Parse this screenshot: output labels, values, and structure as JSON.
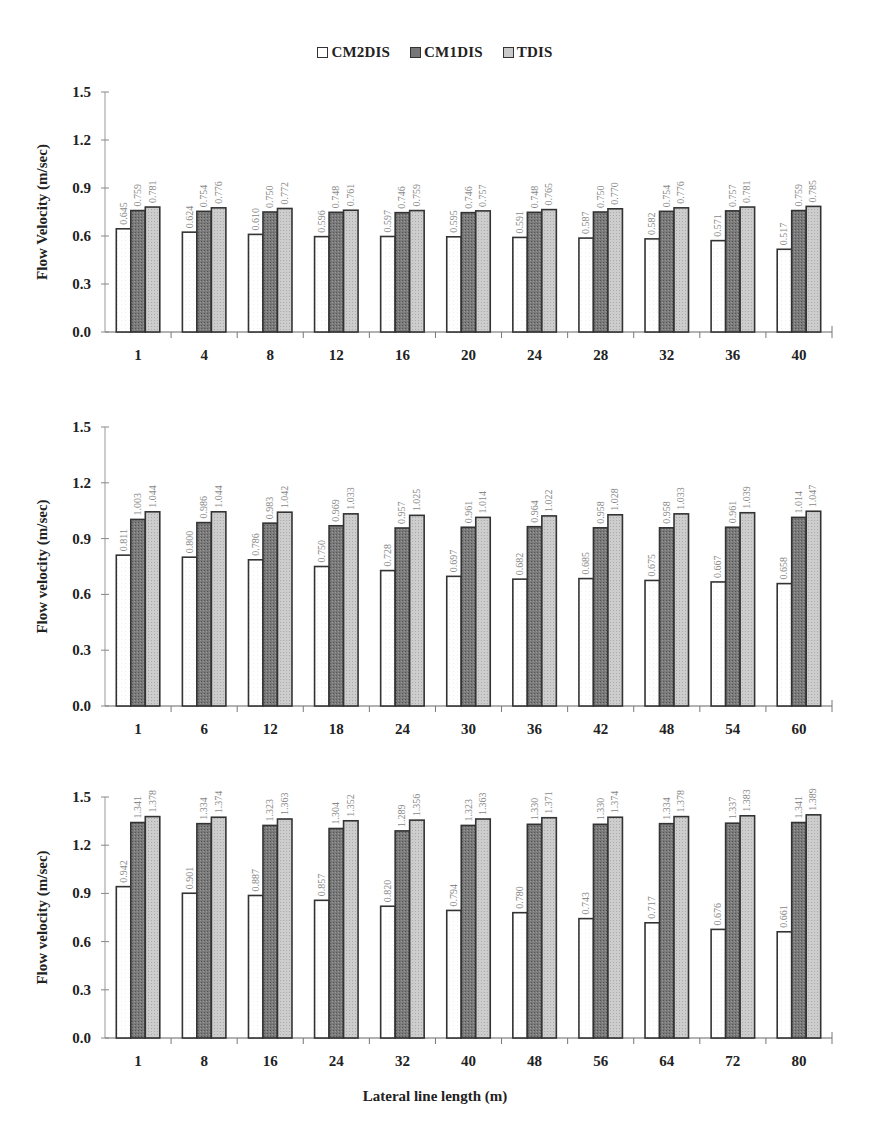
{
  "legend": {
    "items": [
      {
        "label": "CM2DIS",
        "fill": "#ffffff"
      },
      {
        "label": "CM1DIS",
        "fill": "#7a7a7a"
      },
      {
        "label": "TDIS",
        "fill": "#c9c9c9"
      }
    ]
  },
  "x_axis_title": "Lateral line length (m)",
  "chart_data": [
    {
      "type": "bar",
      "title": "",
      "xlabel": "",
      "ylabel": "Flow Velocity (m/sec)",
      "ylim": [
        0,
        1.5
      ],
      "yticks": [
        "0.0",
        "0.3",
        "0.6",
        "0.9",
        "1.2",
        "1.5"
      ],
      "categories": [
        "1",
        "4",
        "8",
        "12",
        "16",
        "20",
        "24",
        "28",
        "32",
        "36",
        "40"
      ],
      "series": [
        {
          "name": "CM2DIS",
          "values": [
            0.645,
            0.624,
            0.61,
            0.596,
            0.597,
            0.595,
            0.591,
            0.587,
            0.582,
            0.571,
            0.517
          ]
        },
        {
          "name": "CM1DIS",
          "values": [
            0.759,
            0.754,
            0.75,
            0.748,
            0.746,
            0.746,
            0.748,
            0.75,
            0.754,
            0.757,
            0.759
          ]
        },
        {
          "name": "TDIS",
          "values": [
            0.781,
            0.776,
            0.772,
            0.761,
            0.759,
            0.757,
            0.765,
            0.77,
            0.776,
            0.781,
            0.785
          ]
        }
      ],
      "grid": false,
      "legend_position": "top"
    },
    {
      "type": "bar",
      "title": "",
      "xlabel": "",
      "ylabel": "Flow velocity (m/sec)",
      "ylim": [
        0,
        1.5
      ],
      "yticks": [
        "0.0",
        "0.3",
        "0.6",
        "0.9",
        "1.2",
        "1.5"
      ],
      "categories": [
        "1",
        "6",
        "12",
        "18",
        "24",
        "30",
        "36",
        "42",
        "48",
        "54",
        "60"
      ],
      "series": [
        {
          "name": "CM2DIS",
          "values": [
            0.811,
            0.8,
            0.786,
            0.75,
            0.728,
            0.697,
            0.682,
            0.685,
            0.675,
            0.667,
            0.658
          ]
        },
        {
          "name": "CM1DIS",
          "values": [
            1.003,
            0.986,
            0.983,
            0.969,
            0.957,
            0.961,
            0.964,
            0.958,
            0.958,
            0.961,
            1.014
          ]
        },
        {
          "name": "TDIS",
          "values": [
            1.044,
            1.044,
            1.042,
            1.033,
            1.025,
            1.014,
            1.022,
            1.028,
            1.033,
            1.039,
            1.047
          ]
        }
      ],
      "grid": false,
      "legend_position": "top"
    },
    {
      "type": "bar",
      "title": "",
      "xlabel": "Lateral line length (m)",
      "ylabel": "Flow velocity (m/sec)",
      "ylim": [
        0,
        1.5
      ],
      "yticks": [
        "0.0",
        "0.3",
        "0.6",
        "0.9",
        "1.2",
        "1.5"
      ],
      "categories": [
        "1",
        "8",
        "16",
        "24",
        "32",
        "40",
        "48",
        "56",
        "64",
        "72",
        "80"
      ],
      "series": [
        {
          "name": "CM2DIS",
          "values": [
            0.942,
            0.901,
            0.887,
            0.857,
            0.82,
            0.794,
            0.78,
            0.743,
            0.717,
            0.676,
            0.661
          ]
        },
        {
          "name": "CM1DIS",
          "values": [
            1.341,
            1.334,
            1.323,
            1.304,
            1.289,
            1.323,
            1.33,
            1.33,
            1.334,
            1.337,
            1.341
          ]
        },
        {
          "name": "TDIS",
          "values": [
            1.378,
            1.374,
            1.363,
            1.352,
            1.356,
            1.363,
            1.371,
            1.374,
            1.378,
            1.383,
            1.389
          ]
        }
      ],
      "grid": false,
      "legend_position": "top"
    }
  ]
}
